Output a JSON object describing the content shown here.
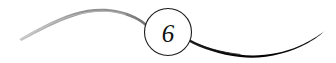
{
  "ornament": {
    "kind": "chapter-number-ornament",
    "number": "6",
    "title": "6",
    "background_color": "#ffffff",
    "medallion": {
      "shape": "circle",
      "center_x": 168,
      "center_y": 32,
      "radius": 23.5,
      "stroke_color": "#1a1a1a",
      "stroke_width": 1.1,
      "fill_color": "#ffffff",
      "label": "6"
    },
    "left_flourish": {
      "name": "left-swash",
      "color": "#9a9a9a",
      "description": "thin tapering grey swash arcing up from lower-left to the medallion",
      "tip_x": 19,
      "tip_y": 39,
      "peak_x": 92,
      "peak_y": 9,
      "join_x": 147,
      "join_y": 25,
      "max_thickness": 3.2
    },
    "right_flourish": {
      "name": "right-swash",
      "color": "#050505",
      "description": "thick tapering black swash sweeping down-right from the medallion then up to a fine point",
      "join_x": 189,
      "join_y": 42,
      "low_x": 262,
      "low_y": 56,
      "tip_x": 324,
      "tip_y": 31,
      "max_thickness": 6.5
    }
  }
}
